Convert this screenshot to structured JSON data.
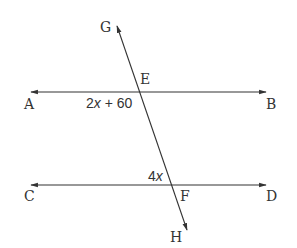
{
  "diagram": {
    "type": "parallel-lines-transversal",
    "points": {
      "A": "A",
      "B": "B",
      "C": "C",
      "D": "D",
      "E": "E",
      "F": "F",
      "G": "G",
      "H": "H"
    },
    "angles": {
      "angle_at_E": {
        "coef": "2",
        "var": "x",
        "rest": " + 60"
      },
      "angle_at_F": {
        "coef": "4",
        "var": "x"
      }
    },
    "lines": [
      "AB",
      "CD",
      "GH"
    ],
    "colors": {
      "line": "#333333",
      "text": "#333333"
    }
  }
}
